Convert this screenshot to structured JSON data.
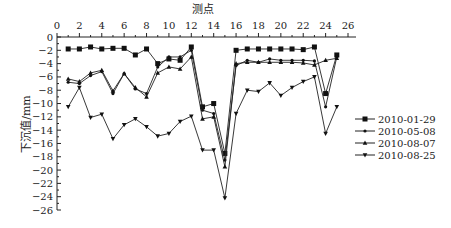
{
  "chart_data": {
    "type": "line",
    "title": "",
    "xlabel": "测点",
    "ylabel": "下沉值/mm",
    "x_axis_position": "top",
    "xlim": [
      0,
      26
    ],
    "ylim": [
      -26,
      0
    ],
    "xticks": [
      0,
      2,
      4,
      6,
      8,
      10,
      12,
      14,
      16,
      18,
      20,
      22,
      24,
      26
    ],
    "yticks": [
      0,
      -2,
      -4,
      -6,
      -8,
      -10,
      -12,
      -14,
      -16,
      -18,
      -20,
      -22,
      -24,
      -26
    ],
    "grid": false,
    "legend_position": "right",
    "x": [
      1,
      2,
      3,
      4,
      5,
      6,
      7,
      8,
      9,
      10,
      11,
      12,
      13,
      14,
      15,
      16,
      17,
      18,
      19,
      20,
      21,
      22,
      23,
      24,
      25
    ],
    "series": [
      {
        "name": "2010-01-29",
        "marker": "square",
        "values": [
          -1.8,
          -1.8,
          -1.5,
          -1.8,
          -1.7,
          -1.7,
          -2.7,
          -1.8,
          -4.0,
          -3.3,
          -3.5,
          -1.5,
          -10.5,
          -10.0,
          -17.5,
          -2.0,
          -1.8,
          -1.8,
          -1.8,
          -1.8,
          -1.8,
          -1.9,
          -1.5,
          -8.5,
          -2.7
        ]
      },
      {
        "name": "2010-05-08",
        "marker": "dot",
        "values": [
          -6.8,
          -7.0,
          -5.8,
          -5.2,
          -8.5,
          -5.5,
          -7.8,
          -8.5,
          -4.5,
          -3.0,
          -3.0,
          -2.0,
          -11.0,
          -11.5,
          -18.5,
          -4.3,
          -3.5,
          -3.8,
          -3.3,
          -3.5,
          -3.5,
          -3.5,
          -3.6,
          -10.5,
          -3.0
        ]
      },
      {
        "name": "2010-08-07",
        "marker": "triangle",
        "values": [
          -6.3,
          -6.7,
          -5.4,
          -5.0,
          -8.1,
          -5.5,
          -7.6,
          -9.0,
          -5.4,
          -4.5,
          -4.8,
          -3.0,
          -12.3,
          -12.0,
          -19.5,
          -4.0,
          -3.8,
          -3.8,
          -3.8,
          -3.8,
          -3.8,
          -3.9,
          -4.2,
          -3.5,
          -3.2
        ]
      },
      {
        "name": "2010-08-25",
        "marker": "down-triangle",
        "values": [
          -10.5,
          -7.6,
          -12.1,
          -11.6,
          -15.3,
          -13.2,
          -12.3,
          -13.5,
          -14.9,
          -14.5,
          -12.7,
          -11.9,
          -17.0,
          -17.0,
          -24.2,
          -11.5,
          -8.0,
          -8.2,
          -6.9,
          -8.8,
          -7.6,
          -6.7,
          -6.0,
          -14.5,
          -10.5
        ]
      }
    ]
  }
}
